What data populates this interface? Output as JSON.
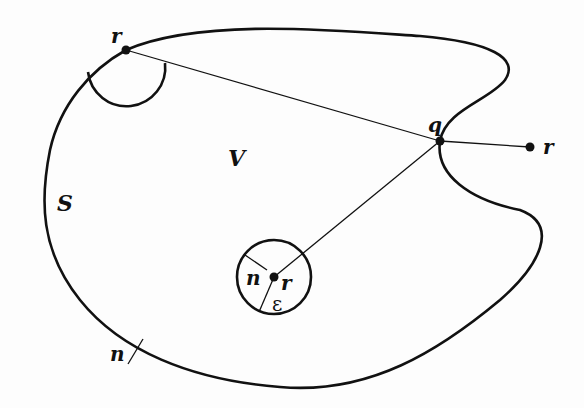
{
  "diagram": {
    "colors": {
      "stroke": "#111111",
      "background": "#fdfdfd"
    },
    "region": {
      "surface_label": "S",
      "volume_label": "V"
    },
    "points": [
      {
        "id": "r_surface",
        "label": "r",
        "role": "point on surface S"
      },
      {
        "id": "q",
        "label": "q",
        "role": "point on surface S"
      },
      {
        "id": "r_outside",
        "label": "r",
        "role": "point outside V"
      },
      {
        "id": "r_inside",
        "label": "r",
        "role": "point inside V, center of small sphere"
      }
    ],
    "small_sphere": {
      "radius_label": "ε",
      "normal_label": "n"
    },
    "surface_normal": {
      "label": "n"
    },
    "hemisphere": {
      "description": "half-circle at surface point r"
    }
  }
}
